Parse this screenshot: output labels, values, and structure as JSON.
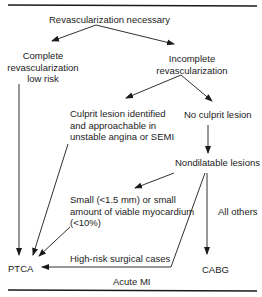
{
  "diagram": {
    "nodes": {
      "root": "Revascularization necessary",
      "complete_1": "Complete",
      "complete_2": "revascularization",
      "complete_3": "low risk",
      "incomplete_1": "Incomplete",
      "incomplete_2": "revascularization",
      "culprit_1": "Culprit lesion identified",
      "culprit_2": "and approachable in",
      "culprit_3": "unstable angina or SEMI",
      "no_culprit": "No culprit lesion",
      "nondilatable": "Nondilatable lesions",
      "small_1": "Small (<1.5 mm) or small",
      "small_2": "amount of viable myocardium",
      "small_3": "(<10%)",
      "all_others": "All others",
      "high_risk": "High-risk surgical cases",
      "ptca": "PTCA",
      "cabg": "CABG",
      "acute_mi": "Acute MI"
    },
    "colors": {
      "line": "#1a1a1a",
      "background": "#ffffff"
    }
  }
}
